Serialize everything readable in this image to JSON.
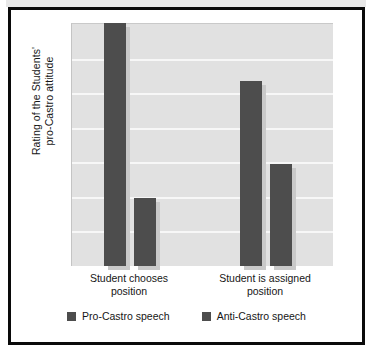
{
  "chart_data": {
    "type": "bar",
    "title": "",
    "xlabel": "",
    "ylabel": "Rating of the Students' pro-Castro attitude",
    "ylabel_lines": [
      "Rating of the Students'",
      "pro-Castro attitude"
    ],
    "categories": [
      "Student chooses position",
      "Student is assigned position"
    ],
    "category_lines": [
      [
        "Student chooses",
        "position"
      ],
      [
        "Student is assigned",
        "position"
      ]
    ],
    "series": [
      {
        "name": "Pro-Castro speech",
        "color": "#4d4d4d",
        "values": [
          100,
          76
        ]
      },
      {
        "name": "Anti-Castro speech",
        "color": "#4d4d4d",
        "values": [
          28,
          42
        ]
      }
    ],
    "ylim": [
      0,
      100
    ],
    "y_tick_labels": [],
    "gridlines": {
      "horizontal": true,
      "count": 6,
      "positions_pct": [
        14.3,
        28.6,
        42.9,
        57.1,
        71.4,
        85.7
      ],
      "color": "#f7f7f7"
    },
    "legend_position": "bottom",
    "plot_background": "#e1e1e1",
    "frame_color": "#0a0a0a",
    "bar_shadow_color": "#c9c9c9",
    "axis_note": "Y axis is unlabeled / unitless rating scale"
  },
  "legend": {
    "items": [
      {
        "label": "Pro-Castro speech",
        "swatch": "#4d4d4d"
      },
      {
        "label": "Anti-Castro speech",
        "swatch": "#4d4d4d"
      }
    ]
  }
}
